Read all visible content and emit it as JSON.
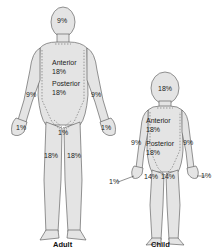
{
  "figures": {
    "adult": {
      "caption": "Adult",
      "head": "9%",
      "anterior_label": "Anterior",
      "anterior_value": "18%",
      "posterior_label": "Posterior",
      "posterior_value": "18%",
      "left_arm": "9%",
      "right_arm": "9%",
      "left_hand": "1%",
      "right_hand": "1%",
      "genitals": "1%",
      "left_leg": "18%",
      "right_leg": "18%"
    },
    "child": {
      "caption": "Child",
      "head": "18%",
      "anterior_label": "Anterior",
      "anterior_value": "18%",
      "posterior_label": "Posterior",
      "posterior_value": "18%",
      "left_arm": "9%",
      "right_arm": "9%",
      "left_hand": "1%",
      "right_hand": "1%",
      "left_leg": "14%",
      "right_leg": "14%"
    }
  },
  "colors": {
    "body_fill": "#e6e6e6",
    "outline": "#555555",
    "dashed": "#666666"
  }
}
